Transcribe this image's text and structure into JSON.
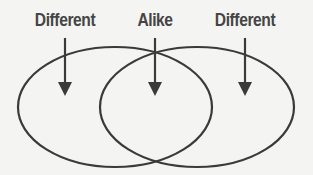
{
  "diagram": {
    "type": "venn",
    "labels": {
      "left": "Different",
      "middle": "Alike",
      "right": "Different"
    },
    "circles": [
      {
        "name": "left-set",
        "cx": 115,
        "cy": 107,
        "rx": 97,
        "ry": 60
      },
      {
        "name": "right-set",
        "cx": 197,
        "cy": 107,
        "rx": 97,
        "ry": 60
      }
    ],
    "colors": {
      "stroke": "#3a3a3a",
      "text": "#454545",
      "background": "#f4f4f2"
    }
  }
}
